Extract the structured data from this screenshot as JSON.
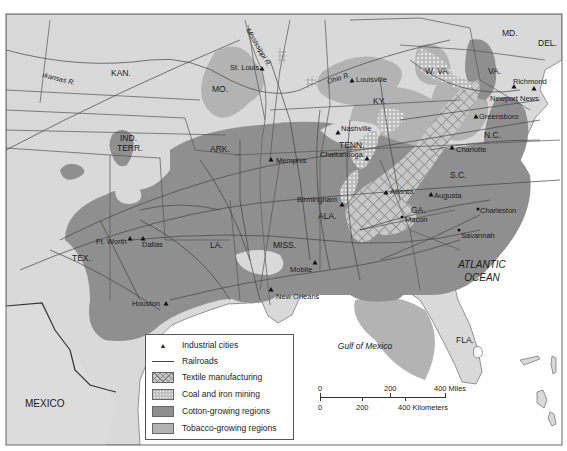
{
  "colors": {
    "land": "#d9d9d9",
    "water": "#ffffff",
    "cotton": "#8f8f8f",
    "tobacco": "#b3b3b3",
    "textile_bg": "#c8c8c8",
    "coal_bg": "#c0c0c0",
    "border": "#444444"
  },
  "water_labels": {
    "atlantic_line1": "ATLANTIC",
    "atlantic_line2": "OCEAN",
    "gulf": "Gulf of Mexico"
  },
  "country_labels": {
    "mexico": "MEXICO"
  },
  "rivers": {
    "arkansas": "rkansas R.",
    "mississippi": "Mississippi R.",
    "ohio": "Ohio R."
  },
  "states": {
    "kan": "KAN.",
    "mo": "MO.",
    "ind_terr_1": "IND.",
    "ind_terr_2": "TERR.",
    "ark": "ARK.",
    "tex": "TEX.",
    "la": "LA.",
    "miss": "MISS.",
    "ala": "ALA.",
    "ga": "GA.",
    "fla": "FLA.",
    "tenn": "TENN.",
    "ky": "KY.",
    "wva": "W. VA.",
    "va": "VA.",
    "md": "MD.",
    "del": "DEL.",
    "nc": "N.C.",
    "sc": "S.C."
  },
  "cities": [
    {
      "name": "St. Louis",
      "industrial": true
    },
    {
      "name": "Louisville",
      "industrial": true
    },
    {
      "name": "Richmond",
      "industrial": true
    },
    {
      "name": "Newport News",
      "industrial": true
    },
    {
      "name": "Greensboro",
      "industrial": true
    },
    {
      "name": "Nashville",
      "industrial": true
    },
    {
      "name": "Chattanooga",
      "industrial": true
    },
    {
      "name": "Charlotte",
      "industrial": true
    },
    {
      "name": "Memphis",
      "industrial": true
    },
    {
      "name": "Atlanta",
      "industrial": true
    },
    {
      "name": "Augusta",
      "industrial": true
    },
    {
      "name": "Birmingham",
      "industrial": true
    },
    {
      "name": "Macon",
      "industrial": false
    },
    {
      "name": "Charleston",
      "industrial": false
    },
    {
      "name": "Savannah",
      "industrial": false
    },
    {
      "name": "Ft. Worth",
      "industrial": true
    },
    {
      "name": "Dallas",
      "industrial": true
    },
    {
      "name": "Mobile",
      "industrial": true
    },
    {
      "name": "New Orleans",
      "industrial": true
    },
    {
      "name": "Houston",
      "industrial": true
    }
  ],
  "legend": {
    "items": [
      {
        "label": "Industrial cities",
        "icon": "triangle-icon"
      },
      {
        "label": "Railroads",
        "icon": "line-icon"
      },
      {
        "label": "Textile manufacturing",
        "icon": "crosshatch-swatch"
      },
      {
        "label": "Coal and iron mining",
        "icon": "dotted-swatch"
      },
      {
        "label": "Cotton-growing regions",
        "icon": "dark-gray-swatch"
      },
      {
        "label": "Tobacco-growing regions",
        "icon": "light-gray-swatch"
      }
    ]
  },
  "scale": {
    "miles": [
      "0",
      "200",
      "400 Miles"
    ],
    "km": [
      "0",
      "200",
      "400 Kilometers"
    ]
  }
}
